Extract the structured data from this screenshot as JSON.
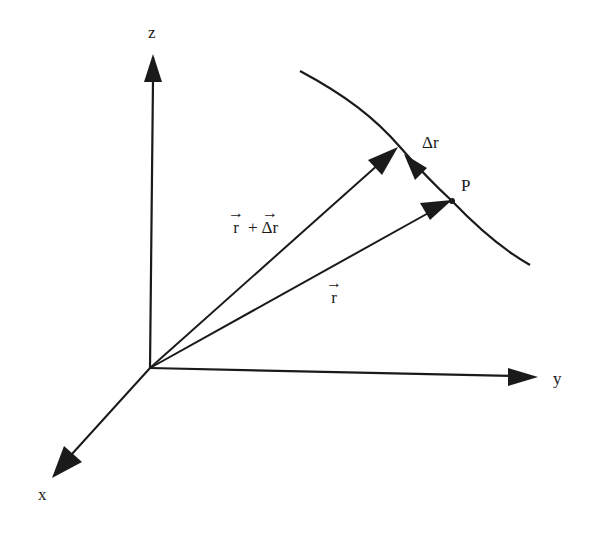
{
  "diagram": {
    "colors": {
      "stroke": "#1a1a1a",
      "background": "#ffffff"
    },
    "axes": {
      "z": {
        "label": "z"
      },
      "y": {
        "label": "y"
      },
      "x": {
        "label": "x"
      }
    },
    "point": {
      "label": "P"
    },
    "curve_increment_label": "Δr",
    "vectors": {
      "r": {
        "symbol": "r",
        "arrow": "→"
      },
      "r_plus_dr": {
        "left": "r",
        "op": "+",
        "right": "Δr",
        "arrow": "→"
      }
    }
  }
}
